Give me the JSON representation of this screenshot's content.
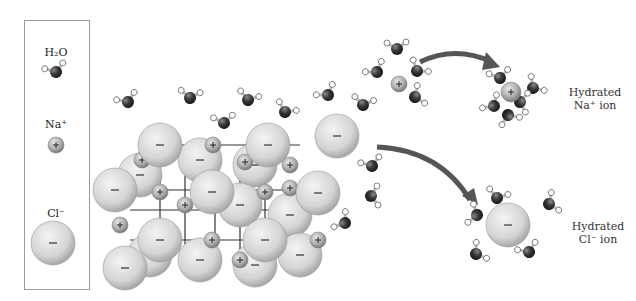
{
  "legend": {
    "water_label": "H₂O",
    "sodium_label": "Na⁺",
    "chloride_label": "Cl⁻",
    "sodium_symbol": "+",
    "chloride_symbol": "–"
  },
  "captions": {
    "hydrated_na_line1": "Hydrated",
    "hydrated_na_line2": "Na⁺ ion",
    "hydrated_cl_line1": "Hydrated",
    "hydrated_cl_line2": "Cl⁻ ion"
  },
  "colors": {
    "oxygen": "#3a3a3a",
    "hydrogen": "#ffffff",
    "chloride": "#d6d6d6",
    "sodium": "#b8b8b8",
    "arrow": "#555555",
    "border": "#9a9a9a"
  }
}
